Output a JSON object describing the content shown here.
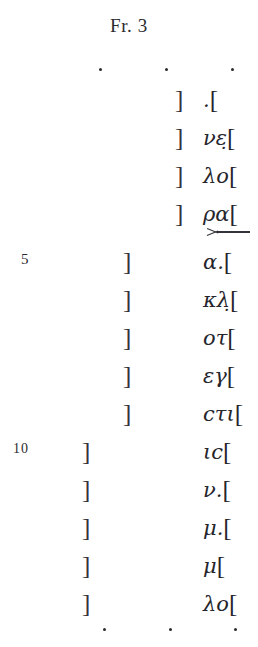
{
  "title": "Fr. 3",
  "top_lacuna_dots": [
    "dot",
    "dot",
    "dot"
  ],
  "bottom_lacuna_dots": [
    "dot",
    "dot",
    "dot"
  ],
  "paragraphos": {
    "symbol": ">—",
    "after_line": 4
  },
  "lines": [
    {
      "number": "",
      "left_bracket": "]",
      "text": ".[",
      "bracket_column": "a"
    },
    {
      "number": "",
      "left_bracket": "]",
      "text": "νε̣[",
      "bracket_column": "a"
    },
    {
      "number": "",
      "left_bracket": "]",
      "text": "λο[",
      "bracket_column": "a"
    },
    {
      "number": "",
      "left_bracket": "]",
      "text": "ρα[",
      "bracket_column": "a"
    },
    {
      "number": "5",
      "left_bracket": "]",
      "text": "α.[",
      "bracket_column": "b"
    },
    {
      "number": "",
      "left_bracket": "]",
      "text": "κλ̣[",
      "bracket_column": "b"
    },
    {
      "number": "",
      "left_bracket": "]",
      "text": "οτ[",
      "bracket_column": "b"
    },
    {
      "number": "",
      "left_bracket": "]",
      "text": "εγ[",
      "bracket_column": "b"
    },
    {
      "number": "",
      "left_bracket": "]",
      "text": "cτι[",
      "bracket_column": "b"
    },
    {
      "number": "10",
      "left_bracket": "]",
      "text": "ιc[",
      "bracket_column": "c"
    },
    {
      "number": "",
      "left_bracket": "]",
      "text": "ν.[",
      "bracket_column": "c"
    },
    {
      "number": "",
      "left_bracket": "]",
      "text": "μ.[",
      "bracket_column": "c"
    },
    {
      "number": "",
      "left_bracket": "]",
      "text": "μ[",
      "bracket_column": "c"
    },
    {
      "number": "",
      "left_bracket": "]",
      "text": "λο[",
      "bracket_column": "c"
    }
  ],
  "colors": {
    "ink": "#25252b",
    "page": "#ffffff"
  }
}
